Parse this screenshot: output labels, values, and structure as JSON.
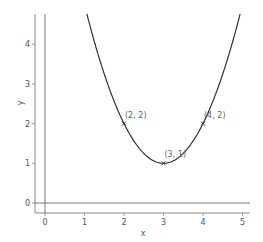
{
  "chart_data": {
    "type": "line",
    "title": "",
    "xlabel": "x",
    "ylabel": "y",
    "xlim": [
      -0.25,
      5.25
    ],
    "ylim": [
      -0.25,
      4.75
    ],
    "xticks": [
      0,
      1,
      2,
      3,
      4,
      5
    ],
    "yticks": [
      0,
      1,
      2,
      3,
      4
    ],
    "grid": false,
    "legend": null,
    "series": [
      {
        "name": "y = (x - 3)^2 + 1",
        "expression": "(x-3)^2+1",
        "color": "#333333",
        "x_range": [
          1.06,
          4.94
        ]
      }
    ],
    "points": [
      {
        "x": 2,
        "y": 2,
        "label": "(2, 2)"
      },
      {
        "x": 3,
        "y": 1,
        "label": "(3, 1)"
      },
      {
        "x": 4,
        "y": 2,
        "label": "(4, 2)"
      }
    ],
    "reference_lines": [
      {
        "type": "vertical",
        "x": 0
      },
      {
        "type": "horizontal",
        "y": 0
      }
    ]
  },
  "colors": {
    "curve": "#333333",
    "axes": "#888888",
    "reference": "#555555",
    "text": "#555555"
  }
}
